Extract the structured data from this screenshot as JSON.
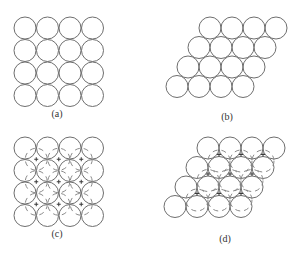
{
  "figure": {
    "panels": [
      {
        "id": "a",
        "label": "(a)",
        "description": "square packing single layer, 4x4 circles"
      },
      {
        "id": "b",
        "label": "(b)",
        "description": "hexagonal close packing single layer, 4 rows x 4 circles"
      },
      {
        "id": "c",
        "label": "(c)",
        "description": "square packing with second layer (dashed) in hollows"
      },
      {
        "id": "d",
        "label": "(d)",
        "description": "hexagonal packing with second layer (dashed) in hollows"
      }
    ],
    "colors": {
      "stroke": "#6e6e6e",
      "dashed": "#8a8a8a",
      "label": "#333333"
    }
  }
}
